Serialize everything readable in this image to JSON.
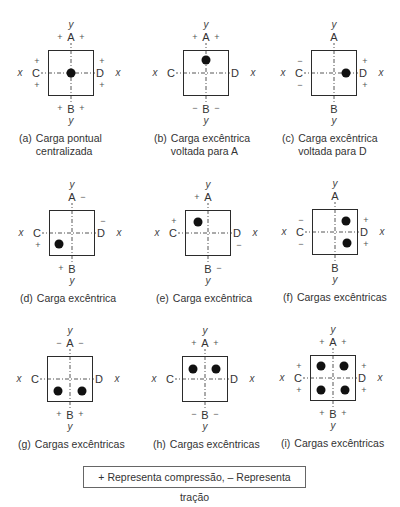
{
  "panels": [
    {
      "id": "a",
      "letter": "(a)",
      "caption": [
        "Carga pontual",
        "centralizada"
      ],
      "ox": 48,
      "oy": 50,
      "dots": [
        [
          23,
          23
        ]
      ],
      "signs": {
        "A": [
          "+",
          "+"
        ],
        "B": [
          "+",
          "+"
        ],
        "C": [
          "+",
          "+"
        ],
        "D": [
          "+",
          "+"
        ]
      }
    },
    {
      "id": "b",
      "letter": "(b)",
      "caption": [
        "Carga excêntrica",
        "voltada para A"
      ],
      "ox": 183,
      "oy": 50,
      "dots": [
        [
          23,
          10
        ]
      ],
      "signs": {
        "A": [
          "+",
          "+"
        ],
        "B": [
          "−",
          "−"
        ],
        "C": [
          "",
          ""
        ],
        "D": [
          "",
          ""
        ]
      }
    },
    {
      "id": "c",
      "letter": "(c)",
      "caption": [
        "Carga excêntrica",
        "voltada para D"
      ],
      "ox": 311,
      "oy": 50,
      "dots": [
        [
          35,
          23
        ]
      ],
      "signs": {
        "A": [
          "",
          ""
        ],
        "B": [
          "",
          ""
        ],
        "C": [
          "−",
          "−"
        ],
        "D": [
          "+",
          "+"
        ]
      }
    },
    {
      "id": "d",
      "letter": "(d)",
      "caption": [
        "Carga excêntrica"
      ],
      "ox": 49,
      "oy": 210,
      "dots": [
        [
          10,
          34
        ]
      ],
      "signs": {
        "A": [
          "",
          "−"
        ],
        "B": [
          "+",
          ""
        ],
        "C": [
          "",
          "+"
        ],
        "D": [
          "−",
          ""
        ]
      }
    },
    {
      "id": "e",
      "letter": "(e)",
      "caption": [
        "Carga excêntrica"
      ],
      "ox": 185,
      "oy": 210,
      "dots": [
        [
          13,
          12
        ]
      ],
      "signs": {
        "A": [
          "+",
          ""
        ],
        "B": [
          "",
          "−"
        ],
        "C": [
          "+",
          ""
        ],
        "D": [
          "",
          "−"
        ]
      }
    },
    {
      "id": "f",
      "letter": "(f)",
      "caption": [
        "Cargas excêntricas"
      ],
      "ox": 312,
      "oy": 209,
      "dots": [
        [
          34,
          12
        ],
        [
          35,
          34
        ]
      ],
      "signs": {
        "A": [
          "",
          ""
        ],
        "B": [
          "",
          ""
        ],
        "C": [
          "−",
          "−"
        ],
        "D": [
          "+",
          "+"
        ]
      }
    },
    {
      "id": "g",
      "letter": "(g)",
      "caption": [
        "Cargas excêntricas"
      ],
      "ox": 47,
      "oy": 356,
      "dots": [
        [
          11,
          35
        ],
        [
          35,
          35
        ]
      ],
      "signs": {
        "A": [
          "−",
          "−"
        ],
        "B": [
          "+",
          "+"
        ],
        "C": [
          "",
          ""
        ],
        "D": [
          "",
          ""
        ]
      }
    },
    {
      "id": "h",
      "letter": "(h)",
      "caption": [
        "Cargas excêntricas"
      ],
      "ox": 182,
      "oy": 356,
      "dots": [
        [
          11,
          13
        ],
        [
          34,
          13
        ]
      ],
      "signs": {
        "A": [
          "+",
          "+"
        ],
        "B": [
          "−",
          "−"
        ],
        "C": [
          "",
          ""
        ],
        "D": [
          "",
          ""
        ]
      }
    },
    {
      "id": "i",
      "letter": "(i)",
      "caption": [
        "Cargas excêntricas"
      ],
      "ox": 310,
      "oy": 355,
      "dots": [
        [
          11,
          11
        ],
        [
          34,
          11
        ],
        [
          11,
          35
        ],
        [
          35,
          35
        ]
      ],
      "signs": {
        "A": [
          "+",
          "+"
        ],
        "B": [
          "+",
          "+"
        ],
        "C": [
          "+",
          "+"
        ],
        "D": [
          "+",
          "+"
        ]
      }
    }
  ],
  "labels": {
    "A": "A",
    "B": "B",
    "C": "C",
    "D": "D",
    "x": "x",
    "y": "y"
  },
  "legend": {
    "text": "+ Representa compressão,  – Representa tração"
  }
}
